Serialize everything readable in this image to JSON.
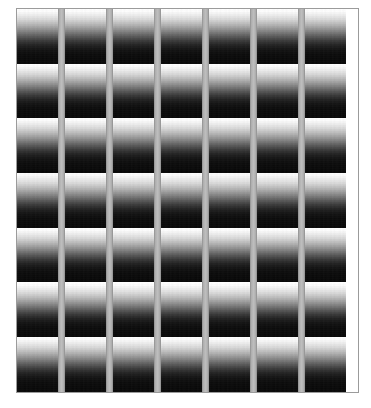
{
  "canvas": {
    "width": 371,
    "height": 408,
    "background_color": "#ffffff",
    "title": "Gradient Grid Pattern"
  },
  "frame": {
    "x": 17,
    "y": 9,
    "width": 341,
    "height": 383,
    "border_color": "#9b9b9b",
    "border_width": 1
  },
  "grid": {
    "columns": 7,
    "rows": 7,
    "cell_width": 41,
    "cell_height": 54.7,
    "separator_width": 7,
    "separator_color": "#b5b5b5",
    "gradient_top_color": "#ffffff",
    "gradient_bottom_color": "#090909",
    "gradient_direction": "top-to-bottom",
    "column_x": [
      0,
      48,
      96,
      144,
      192,
      240,
      288
    ],
    "separator_x": [
      41,
      89,
      137,
      185,
      233,
      281
    ],
    "row_y": [
      0,
      54.7,
      109.4,
      164.1,
      218.8,
      273.5,
      328.2
    ]
  },
  "chart_data": {
    "type": "heatmap",
    "title": "Gradient Grid Pattern",
    "xlabel": "",
    "ylabel": "",
    "categories": [
      "C1",
      "C2",
      "C3",
      "C4",
      "C5",
      "C6",
      "C7"
    ],
    "rows": [
      "R1",
      "R2",
      "R3",
      "R4",
      "R5",
      "R6",
      "R7"
    ],
    "grid": false,
    "legend": "none",
    "value_range": [
      0,
      255
    ],
    "cell_profile_luminance": [
      255,
      253,
      240,
      216,
      180,
      138,
      94,
      58,
      34,
      20,
      13,
      10,
      9
    ]
  }
}
